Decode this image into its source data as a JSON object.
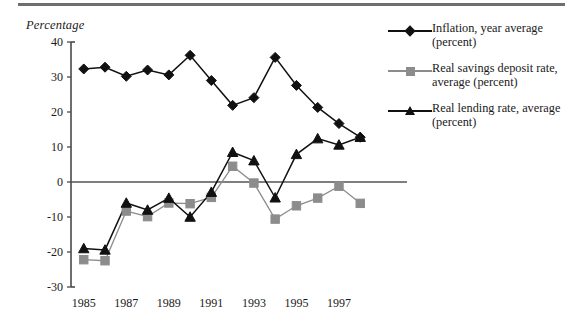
{
  "figure": {
    "axis_title": "Percentage",
    "top_rule": true
  },
  "legend": {
    "position": "right",
    "items": [
      {
        "marker": "diamond",
        "color": "#111111",
        "label": "Inflation, year average (percent)",
        "line1": "Inflation, year average",
        "line2": "(percent)"
      },
      {
        "marker": "square",
        "color": "#8c8c8c",
        "label": "Real savings deposit rate, average (percent)",
        "line1": "Real savings deposit rate,",
        "line2": "average (percent)"
      },
      {
        "marker": "triangle",
        "color": "#111111",
        "label": "Real lending rate, average (percent)",
        "line1": "Real lending rate, average",
        "line2": "(percent)"
      }
    ]
  },
  "chart_data": {
    "type": "line",
    "title": "",
    "xlabel": "",
    "ylabel": "Percentage",
    "grid": false,
    "legend_position": "right",
    "x": [
      1985,
      1986,
      1987,
      1988,
      1989,
      1990,
      1991,
      1992,
      1993,
      1994,
      1995,
      1996,
      1997,
      1998
    ],
    "xtick_labels": [
      "1985",
      "1987",
      "1989",
      "1991",
      "1993",
      "1995",
      "1997"
    ],
    "xticks": [
      1985,
      1987,
      1989,
      1991,
      1993,
      1995,
      1997
    ],
    "ytick_labels": [
      "40",
      "30",
      "20",
      "10",
      "0",
      "-10",
      "-20",
      "-30"
    ],
    "yticks": [
      40,
      30,
      20,
      10,
      0,
      -10,
      -20,
      -30
    ],
    "ylim": [
      -30,
      40
    ],
    "xlim": [
      1984.4,
      1998.6
    ],
    "zero_line": 0,
    "series": [
      {
        "name": "Inflation, year average (percent)",
        "marker": "diamond",
        "color": "#111111",
        "values": [
          32.3,
          32.8,
          30.2,
          32.0,
          30.6,
          36.2,
          29.0,
          21.9,
          24.1,
          35.6,
          27.6,
          21.3,
          16.7,
          12.8
        ]
      },
      {
        "name": "Real savings deposit rate, average (percent)",
        "marker": "square",
        "color": "#8c8c8c",
        "values": [
          -22.2,
          -22.5,
          -8.3,
          -9.9,
          -6.0,
          -6.2,
          -4.4,
          4.5,
          -0.3,
          -10.6,
          -6.8,
          -4.6,
          -1.2,
          -6.1
        ]
      },
      {
        "name": "Real lending rate, average (percent)",
        "marker": "triangle",
        "color": "#111111",
        "values": [
          -19.0,
          -19.4,
          -6.0,
          -8.0,
          -4.6,
          -10.0,
          -2.9,
          8.5,
          6.1,
          -4.5,
          7.9,
          12.4,
          10.6,
          12.8
        ]
      }
    ]
  }
}
